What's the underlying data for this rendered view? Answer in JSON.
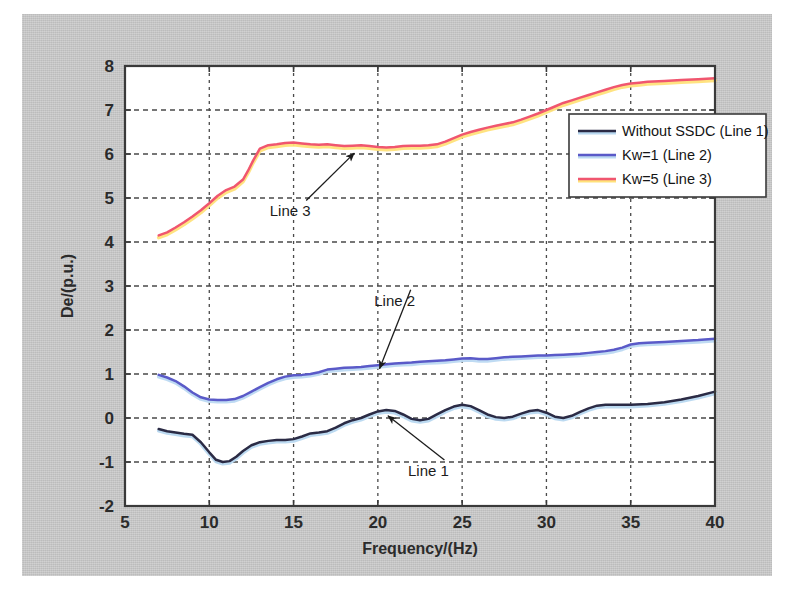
{
  "figure": {
    "background_color": "#c9c9c9",
    "plot_background_color": "#ffffff",
    "axis_color": "#3a3a3a",
    "grid_color": "#4a4a4a"
  },
  "chart_data": {
    "type": "line",
    "title": "",
    "xlabel": "Frequency/(Hz)",
    "ylabel": "De/(p.u.)",
    "xlim": [
      5,
      40
    ],
    "ylim": [
      -2,
      8
    ],
    "xticks": [
      5,
      10,
      15,
      20,
      25,
      30,
      35,
      40
    ],
    "xtick_labels": [
      "5",
      "10",
      "15",
      "20",
      "25",
      "30",
      "35",
      "40"
    ],
    "yticks": [
      -2,
      -1,
      0,
      1,
      2,
      3,
      4,
      5,
      6,
      7,
      8
    ],
    "ytick_labels": [
      "-2",
      "-1",
      "0",
      "1",
      "2",
      "3",
      "4",
      "5",
      "6",
      "7",
      "8"
    ],
    "grid": true,
    "grid_style": "dotted",
    "legend_position": "right-upper",
    "series": [
      {
        "name": "Without SSDC (Line 1)",
        "color": "#2b2b45",
        "highlight_color": "#b8d8f0",
        "x": [
          7.0,
          7.5,
          8.0,
          8.5,
          9.0,
          9.5,
          10.0,
          10.4,
          10.8,
          11.2,
          11.6,
          12.0,
          12.5,
          13.0,
          13.5,
          14.0,
          14.5,
          15.0,
          15.5,
          16.0,
          16.5,
          17.0,
          17.5,
          18.0,
          18.5,
          19.0,
          19.5,
          20.0,
          20.5,
          21.0,
          21.5,
          22.0,
          22.5,
          23.0,
          23.5,
          24.0,
          24.5,
          25.0,
          25.5,
          26.0,
          26.5,
          27.0,
          27.5,
          28.0,
          28.5,
          29.0,
          29.5,
          30.0,
          30.5,
          31.0,
          31.5,
          32.0,
          32.5,
          33.0,
          33.5,
          34.0,
          34.5,
          35.0,
          36.0,
          37.0,
          38.0,
          39.0,
          40.0
        ],
        "y": [
          -0.25,
          -0.3,
          -0.33,
          -0.36,
          -0.38,
          -0.55,
          -0.78,
          -0.95,
          -1.0,
          -0.98,
          -0.88,
          -0.75,
          -0.62,
          -0.55,
          -0.52,
          -0.5,
          -0.5,
          -0.48,
          -0.42,
          -0.35,
          -0.33,
          -0.3,
          -0.22,
          -0.12,
          -0.05,
          0.0,
          0.08,
          0.15,
          0.18,
          0.16,
          0.08,
          -0.02,
          -0.05,
          -0.02,
          0.08,
          0.18,
          0.26,
          0.3,
          0.27,
          0.18,
          0.08,
          0.02,
          0.0,
          0.03,
          0.1,
          0.16,
          0.18,
          0.12,
          0.03,
          0.0,
          0.05,
          0.14,
          0.22,
          0.28,
          0.3,
          0.3,
          0.3,
          0.3,
          0.32,
          0.36,
          0.42,
          0.5,
          0.6
        ]
      },
      {
        "name": "Kw=1 (Line 2)",
        "color": "#5a5ac8",
        "highlight_color": "#bcd9f2",
        "x": [
          7.0,
          7.5,
          8.0,
          8.5,
          9.0,
          9.5,
          10.0,
          10.5,
          11.0,
          11.5,
          12.0,
          12.5,
          13.0,
          13.5,
          14.0,
          14.5,
          15.0,
          15.5,
          16.0,
          16.5,
          17.0,
          17.5,
          18.0,
          18.5,
          19.0,
          19.5,
          20.0,
          20.5,
          21.0,
          21.5,
          22.0,
          22.5,
          23.0,
          23.5,
          24.0,
          24.5,
          25.0,
          25.5,
          26.0,
          26.5,
          27.0,
          27.5,
          28.0,
          28.5,
          29.0,
          29.5,
          30.0,
          30.5,
          31.0,
          31.5,
          32.0,
          32.5,
          33.0,
          33.5,
          34.0,
          34.5,
          35.0,
          35.5,
          36.0,
          37.0,
          38.0,
          39.0,
          40.0
        ],
        "y": [
          0.98,
          0.92,
          0.84,
          0.72,
          0.58,
          0.47,
          0.42,
          0.41,
          0.41,
          0.43,
          0.5,
          0.6,
          0.7,
          0.8,
          0.88,
          0.94,
          0.97,
          0.98,
          1.0,
          1.04,
          1.1,
          1.12,
          1.14,
          1.15,
          1.16,
          1.18,
          1.2,
          1.22,
          1.24,
          1.25,
          1.26,
          1.28,
          1.29,
          1.3,
          1.31,
          1.33,
          1.35,
          1.36,
          1.34,
          1.34,
          1.36,
          1.38,
          1.39,
          1.4,
          1.41,
          1.42,
          1.42,
          1.43,
          1.44,
          1.45,
          1.46,
          1.48,
          1.5,
          1.52,
          1.55,
          1.6,
          1.67,
          1.7,
          1.71,
          1.73,
          1.75,
          1.77,
          1.8
        ]
      },
      {
        "name": "Kw=5 (Line 3)",
        "color": "#f0566f",
        "highlight_color": "#ffe27a",
        "x": [
          7.0,
          7.5,
          8.0,
          8.5,
          9.0,
          9.5,
          10.0,
          10.5,
          11.0,
          11.5,
          12.0,
          12.3,
          12.6,
          13.0,
          13.5,
          14.0,
          14.5,
          15.0,
          15.5,
          16.0,
          16.5,
          17.0,
          17.5,
          18.0,
          18.5,
          19.0,
          19.5,
          20.0,
          20.5,
          21.0,
          21.5,
          22.0,
          22.5,
          23.0,
          23.5,
          24.0,
          24.5,
          25.0,
          25.5,
          26.0,
          26.5,
          27.0,
          27.5,
          28.0,
          28.5,
          29.0,
          29.5,
          30.0,
          30.5,
          31.0,
          31.5,
          32.0,
          32.5,
          33.0,
          33.5,
          34.0,
          34.5,
          35.0,
          35.5,
          36.0,
          37.0,
          38.0,
          39.0,
          40.0
        ],
        "y": [
          4.15,
          4.22,
          4.33,
          4.45,
          4.58,
          4.72,
          4.88,
          5.05,
          5.18,
          5.26,
          5.42,
          5.62,
          5.85,
          6.12,
          6.2,
          6.22,
          6.25,
          6.26,
          6.24,
          6.22,
          6.21,
          6.22,
          6.2,
          6.18,
          6.19,
          6.2,
          6.18,
          6.16,
          6.15,
          6.16,
          6.18,
          6.19,
          6.19,
          6.2,
          6.22,
          6.28,
          6.36,
          6.44,
          6.5,
          6.55,
          6.6,
          6.64,
          6.68,
          6.72,
          6.78,
          6.85,
          6.92,
          7.0,
          7.08,
          7.16,
          7.22,
          7.28,
          7.34,
          7.4,
          7.46,
          7.52,
          7.57,
          7.6,
          7.62,
          7.64,
          7.66,
          7.68,
          7.7,
          7.72
        ]
      }
    ],
    "annotations": [
      {
        "text": "Line 1",
        "label_x": 23.0,
        "label_y": -1.32,
        "point_x": 20.6,
        "point_y": 0.05
      },
      {
        "text": "Line 2",
        "label_x": 21.0,
        "label_y": 2.55,
        "point_x": 20.1,
        "point_y": 1.12
      },
      {
        "text": "Line 3",
        "label_x": 14.8,
        "label_y": 4.58,
        "point_x": 18.6,
        "point_y": 6.02
      }
    ]
  },
  "legend": {
    "items": [
      {
        "label": "Without SSDC (Line 1)",
        "color": "#2b2b45"
      },
      {
        "label": "Kw=1 (Line 2)",
        "color": "#5a5ac8"
      },
      {
        "label": "Kw=5 (Line 3)",
        "color": "#f0566f"
      }
    ]
  }
}
